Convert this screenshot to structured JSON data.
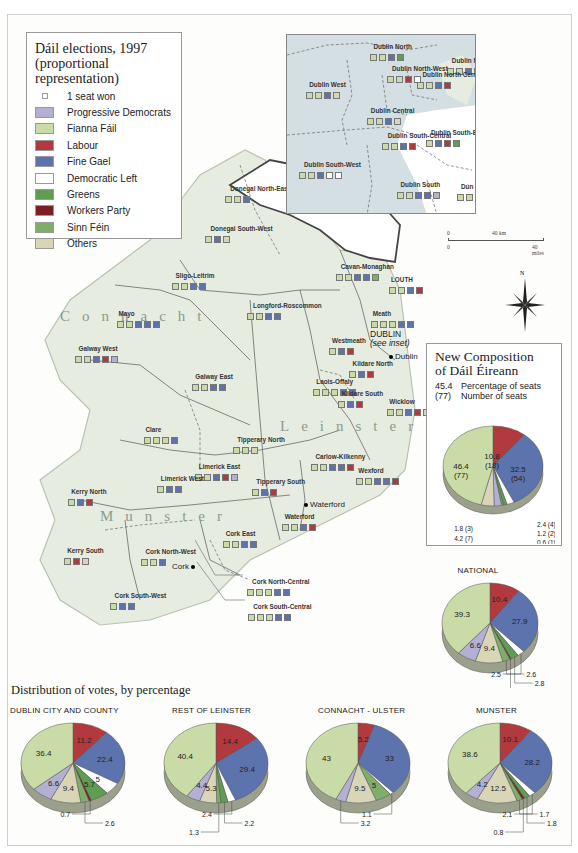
{
  "legend": {
    "title_line1": "Dáil elections, 1997",
    "title_line2": "(proportional representation)",
    "items": [
      {
        "label": "1 seat won",
        "color": "#ffffff",
        "small": true
      },
      {
        "label": "Progressive Democrats",
        "color": "#b4b0d4"
      },
      {
        "label": "Fianna Fáil",
        "color": "#c9dca8"
      },
      {
        "label": "Labour",
        "color": "#b23a3e"
      },
      {
        "label": "Fine Gael",
        "color": "#5d73ae"
      },
      {
        "label": "Democratic Left",
        "color": "#ffffff"
      },
      {
        "label": "Greens",
        "color": "#5f9d52"
      },
      {
        "label": "Workers Party",
        "color": "#7a1f26"
      },
      {
        "label": "Sinn Féin",
        "color": "#7eae6a"
      },
      {
        "label": "Others",
        "color": "#d9d6b8"
      }
    ]
  },
  "colors": {
    "PD": "#b4b0d4",
    "FF": "#c9dca8",
    "LAB": "#b23a3e",
    "FG": "#5d73ae",
    "DL": "#ffffff",
    "GR": "#5f9d52",
    "WP": "#7a1f26",
    "SF": "#7eae6a",
    "OTH": "#d9d6b8",
    "land": "#e6ece0",
    "inset_bg": "#d4dfe4",
    "border": "#555555"
  },
  "map": {
    "provinces": [
      "Connacht",
      "Leinster",
      "Munster"
    ],
    "towns": [
      "Dublin",
      "Waterford",
      "Cork"
    ],
    "dublin_note_line1": "DUBLIN",
    "dublin_note_line2": "(see inset)",
    "scale": {
      "km_zero": "0",
      "km_label": "40 km",
      "mi_zero": "0",
      "mi_label": "40 miles"
    },
    "compass_label": "N",
    "constituencies": [
      {
        "name": "Donegal North-East",
        "x": 225,
        "y": 185,
        "seats": [
          "FF",
          "FF",
          "FG"
        ]
      },
      {
        "name": "Donegal South-West",
        "x": 205,
        "y": 225,
        "seats": [
          "FF",
          "FG",
          "OTH"
        ]
      },
      {
        "name": "Sligo-Leitrim",
        "x": 172,
        "y": 272,
        "seats": [
          "FF",
          "FF",
          "FG",
          "FG"
        ]
      },
      {
        "name": "Mayo",
        "x": 117,
        "y": 310,
        "seats": [
          "FF",
          "FF",
          "FG",
          "FG",
          "FG"
        ]
      },
      {
        "name": "Cavan-Monaghan",
        "x": 336,
        "y": 263,
        "seats": [
          "FF",
          "FF",
          "FG",
          "FG",
          "SF"
        ]
      },
      {
        "name": "LOUTH",
        "x": 389,
        "y": 276,
        "seats": [
          "FF",
          "FF",
          "FG",
          "LAB"
        ]
      },
      {
        "name": "Longford-Roscommon",
        "x": 247,
        "y": 302,
        "seats": [
          "FF",
          "FF",
          "FG",
          "FG"
        ]
      },
      {
        "name": "Meath",
        "x": 371,
        "y": 310,
        "seats": [
          "FF",
          "FF",
          "FF",
          "FG",
          "FG"
        ]
      },
      {
        "name": "Westmeath",
        "x": 329,
        "y": 337,
        "seats": [
          "FF",
          "FG",
          "LAB"
        ]
      },
      {
        "name": "Galway West",
        "x": 75,
        "y": 345,
        "seats": [
          "FF",
          "FF",
          "FG",
          "LAB",
          "PD"
        ]
      },
      {
        "name": "Galway East",
        "x": 192,
        "y": 373,
        "seats": [
          "FF",
          "FF",
          "FG",
          "FG"
        ]
      },
      {
        "name": "Kildare North",
        "x": 349,
        "y": 360,
        "seats": [
          "FF",
          "FG",
          "LAB"
        ]
      },
      {
        "name": "Laois-Offaly",
        "x": 313,
        "y": 378,
        "seats": [
          "FF",
          "FF",
          "FF",
          "FG",
          "FG"
        ]
      },
      {
        "name": "Kildare South",
        "x": 338,
        "y": 390,
        "seats": [
          "FF",
          "FG",
          "LAB"
        ]
      },
      {
        "name": "Wicklow",
        "x": 387,
        "y": 398,
        "seats": [
          "FF",
          "FF",
          "FG",
          "LAB",
          "OTH"
        ]
      },
      {
        "name": "Clare",
        "x": 144,
        "y": 426,
        "seats": [
          "FF",
          "FF",
          "FF",
          "FG"
        ]
      },
      {
        "name": "Tipperary North",
        "x": 233,
        "y": 436,
        "seats": [
          "FF",
          "FF",
          "OTH"
        ]
      },
      {
        "name": "Carlow-Kilkenny",
        "x": 311,
        "y": 453,
        "seats": [
          "FF",
          "FF",
          "FG",
          "FG",
          "LAB"
        ]
      },
      {
        "name": "Limerick East",
        "x": 195,
        "y": 463,
        "seats": [
          "FF",
          "FF",
          "FG",
          "LAB",
          "PD"
        ]
      },
      {
        "name": "Wexford",
        "x": 356,
        "y": 467,
        "seats": [
          "FF",
          "FF",
          "FG",
          "FG",
          "LAB"
        ]
      },
      {
        "name": "Limerick West",
        "x": 157,
        "y": 475,
        "seats": [
          "FF",
          "FG",
          "FG"
        ]
      },
      {
        "name": "Tipperary South",
        "x": 252,
        "y": 478,
        "seats": [
          "FF",
          "FG",
          "LAB"
        ]
      },
      {
        "name": "Kerry North",
        "x": 68,
        "y": 488,
        "seats": [
          "FF",
          "FG",
          "LAB"
        ]
      },
      {
        "name": "Waterford",
        "x": 282,
        "y": 513,
        "seats": [
          "FF",
          "FF",
          "FG",
          "LAB"
        ]
      },
      {
        "name": "Cork East",
        "x": 223,
        "y": 530,
        "seats": [
          "FF",
          "FF",
          "FG",
          "FG"
        ]
      },
      {
        "name": "Kerry South",
        "x": 64,
        "y": 547,
        "seats": [
          "FF",
          "LAB",
          "OTH"
        ]
      },
      {
        "name": "Cork North-West",
        "x": 141,
        "y": 548,
        "seats": [
          "FF",
          "FF",
          "FG"
        ]
      },
      {
        "name": "Cork North-Central",
        "x": 247,
        "y": 578,
        "seats": [
          "FF",
          "FF",
          "FF",
          "FG",
          "FG"
        ]
      },
      {
        "name": "Cork South-West",
        "x": 110,
        "y": 592,
        "seats": [
          "FF",
          "FG",
          "FG"
        ]
      },
      {
        "name": "Cork South-Central",
        "x": 248,
        "y": 603,
        "seats": [
          "FF",
          "FF",
          "FF",
          "FG",
          "FG"
        ]
      }
    ],
    "inset_constituencies": [
      {
        "name": "Dublin North",
        "x": 83,
        "y": 8,
        "seats": [
          "FF",
          "FF",
          "FG",
          "GR"
        ]
      },
      {
        "name": "Dublin North-East",
        "x": 160,
        "y": 22,
        "seats": [
          "FF",
          "FF",
          "FG",
          "LAB"
        ]
      },
      {
        "name": "Dublin West",
        "x": 19,
        "y": 46,
        "seats": [
          "FF",
          "FF",
          "FG",
          "OTH"
        ]
      },
      {
        "name": "Dublin North-West",
        "x": 100,
        "y": 30,
        "seats": [
          "FF",
          "FF",
          "LAB",
          "DL"
        ]
      },
      {
        "name": "Dublin North Central",
        "x": 130,
        "y": 36,
        "seats": [
          "FF",
          "FF",
          "FG",
          "LAB"
        ]
      },
      {
        "name": "Dublin Central",
        "x": 80,
        "y": 72,
        "seats": [
          "FF",
          "FF",
          "FG",
          "OTH"
        ]
      },
      {
        "name": "Dublin South-Central",
        "x": 95,
        "y": 97,
        "seats": [
          "FF",
          "FF",
          "FG",
          "LAB"
        ]
      },
      {
        "name": "Dublin South-East",
        "x": 139,
        "y": 94,
        "seats": [
          "FF",
          "FG",
          "LAB",
          "GR"
        ]
      },
      {
        "name": "Dublin South-West",
        "x": 12,
        "y": 126,
        "seats": [
          "FF",
          "FF",
          "FG",
          "DL",
          "DL"
        ]
      },
      {
        "name": "Dublin South",
        "x": 110,
        "y": 146,
        "seats": [
          "FF",
          "FF",
          "FG",
          "FG",
          "PD"
        ]
      },
      {
        "name": "Dún Laoghaire",
        "x": 170,
        "y": 148,
        "seats": [
          "FF",
          "FF",
          "FG",
          "FG",
          "DL"
        ]
      }
    ]
  },
  "composition": {
    "title_line1": "New Composition",
    "title_line2": "of Dáil Éireann",
    "key_pct_value": "45.4",
    "key_pct_label": "Percentage of seats",
    "key_num_value": "(77)",
    "key_num_label": "Number of seats"
  },
  "section_title": "Distribution of votes, by percentage",
  "chart_data": [
    {
      "type": "pie",
      "title": "New Composition of Dáil Éireann",
      "categories": [
        "Labour",
        "Fine Gael",
        "Democratic Left",
        "Greens",
        "Workers Party",
        "Sinn Féin",
        "Progressive Democrats",
        "Others",
        "Fianna Fáil"
      ],
      "values": [
        10.8,
        32.5,
        2.4,
        1.2,
        0.0,
        0.6,
        2.4,
        4.2,
        46.4
      ],
      "seats": [
        18,
        54,
        4,
        2,
        0,
        1,
        4,
        7,
        77
      ],
      "labels": [
        {
          "text": "10.8\n(18)",
          "slice": "Labour"
        },
        {
          "text": "32.5\n(54)",
          "slice": "Fine Gael"
        },
        {
          "text": "2.4 (4)",
          "slice": "Democratic Left"
        },
        {
          "text": "1.2 (2)",
          "slice": "Greens"
        },
        {
          "text": "0.6 (1)",
          "slice": "Sinn Féin"
        },
        {
          "text": "4.2 (7)",
          "slice": "Progressive Democrats"
        },
        {
          "text": "1.8 (3)",
          "slice": "Others"
        },
        {
          "text": "46.4\n(77)",
          "slice": "Fianna Fáil"
        }
      ]
    },
    {
      "type": "pie",
      "title": "NATIONAL",
      "categories": [
        "Labour",
        "Fine Gael",
        "Democratic Left",
        "Greens",
        "Workers Party",
        "Sinn Féin",
        "Others",
        "Progressive Democrats",
        "Fianna Fáil"
      ],
      "values": [
        10.4,
        27.9,
        2.5,
        2.8,
        0.4,
        2.6,
        9.4,
        6.6,
        39.3
      ],
      "label_texts": [
        "10.4",
        "27.9",
        "2.5",
        "2.8",
        "0.4 (Wp)",
        "2.6",
        "9.4",
        "6.6",
        "39.3"
      ]
    },
    {
      "type": "pie",
      "title": "DUBLIN CITY AND COUNTY",
      "categories": [
        "Labour",
        "Fine Gael",
        "Democratic Left",
        "Greens",
        "Workers Party",
        "Sinn Féin",
        "Others",
        "Progressive Democrats",
        "Fianna Fáil"
      ],
      "values": [
        11.2,
        22.4,
        5,
        5.7,
        0.7,
        2.6,
        9.4,
        6.6,
        36.4
      ]
    },
    {
      "type": "pie",
      "title": "REST OF LEINSTER",
      "categories": [
        "Labour",
        "Fine Gael",
        "Democratic Left",
        "Greens",
        "Sinn Féin",
        "Others",
        "Progressive Democrats",
        "Fianna Fáil"
      ],
      "values": [
        14.4,
        29.4,
        2.4,
        2.2,
        1.3,
        5.3,
        4.4,
        40.4
      ]
    },
    {
      "type": "pie",
      "title": "CONNACHT - ULSTER",
      "categories": [
        "Labour",
        "Fine Gael",
        "Democratic Left",
        "Sinn Féin",
        "Others",
        "Progressive Democrats",
        "Fianna Fáil"
      ],
      "values": [
        5.2,
        33,
        1.1,
        5,
        9.5,
        3.2,
        43
      ]
    },
    {
      "type": "pie",
      "title": "MUNSTER",
      "categories": [
        "Labour",
        "Fine Gael",
        "Democratic Left",
        "Greens",
        "Workers Party",
        "Sinn Féin",
        "Others",
        "Progressive Democrats",
        "Fianna Fáil"
      ],
      "values": [
        10.1,
        28.2,
        2.1,
        1.8,
        0.8,
        1.7,
        12.5,
        4.2,
        38.6
      ]
    }
  ]
}
